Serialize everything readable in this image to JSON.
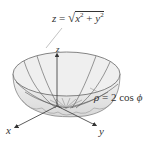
{
  "figure": {
    "labels": {
      "cone": {
        "lhs": "z",
        "eq": " = ",
        "sqrt": "√",
        "x": "x",
        "x_exp": "2",
        "plus": " + ",
        "y": "y",
        "y_exp": "2"
      },
      "sphere": {
        "lhs": "ρ",
        "eq": " = 2 cos ",
        "phi": "ϕ"
      },
      "axes": {
        "x": "x",
        "y": "y",
        "z": "z"
      }
    },
    "colors": {
      "surface_fill": "#e4e4e4",
      "surface_inner": "#f2f2f2",
      "lines": "#555555",
      "axes": "#333333",
      "text": "#333333"
    }
  }
}
